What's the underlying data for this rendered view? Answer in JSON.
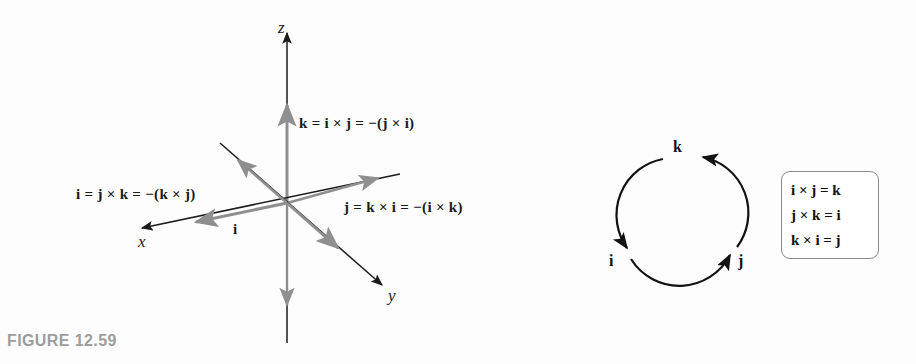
{
  "figure": {
    "caption": "FIGURE 12.59",
    "caption_color": "#9d9d9d",
    "background_color": "#fdfdfd"
  },
  "colors": {
    "axis_black": "#1b1b1b",
    "vector_gray": "#8f8f8f",
    "box_border": "#8a8a8a",
    "text_black": "#111111"
  },
  "axes_diagram": {
    "axis_labels": {
      "x": "x",
      "y": "y",
      "z": "z"
    },
    "vector_label_i": "i",
    "equations": {
      "k_equation": "k = i × j = −(j × i)",
      "i_equation": "i = j × k = −(k × j)",
      "j_equation": "j = k × i = −(i × k)"
    }
  },
  "cycle_diagram": {
    "nodes": [
      {
        "label": "k",
        "position": "top"
      },
      {
        "label": "i",
        "position": "lower-left"
      },
      {
        "label": "j",
        "position": "lower-right"
      }
    ],
    "direction": "counterclockwise k → i → j → k"
  },
  "identity_box": {
    "lines": [
      "i × j = k",
      "j × k = i",
      "k × i = j"
    ]
  }
}
